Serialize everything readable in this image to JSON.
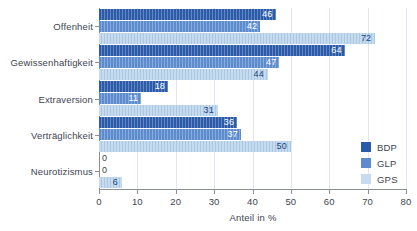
{
  "chart_data": {
    "type": "bar",
    "orientation": "horizontal",
    "title": "",
    "subtitle": "",
    "xlabel": "Anteil in %",
    "ylabel": "",
    "xlim": [
      0,
      80
    ],
    "xticks": [
      0,
      10,
      20,
      30,
      40,
      50,
      60,
      70,
      80
    ],
    "xtick_labels": [
      "0",
      "10",
      "20",
      "30",
      "40",
      "50",
      "60",
      "70",
      "80"
    ],
    "grid": true,
    "grid_axis": "x",
    "legend_position": "right-middle",
    "categories": [
      "Offenheit",
      "Gewissenhaftigkeit",
      "Extraversion",
      "Verträglichkeit",
      "Neurotizismus"
    ],
    "series": [
      {
        "name": "BDP",
        "color": "#2a5aa8",
        "values": [
          46,
          64,
          18,
          36,
          0
        ]
      },
      {
        "name": "GLP",
        "color": "#5c8bce",
        "values": [
          42,
          47,
          11,
          37,
          0
        ]
      },
      {
        "name": "GPS",
        "color": "#c5dcf0",
        "values": [
          72,
          44,
          31,
          50,
          6
        ]
      }
    ],
    "value_labels": [
      [
        "46",
        "42",
        "72"
      ],
      [
        "64",
        "47",
        "44"
      ],
      [
        "18",
        "11",
        "31"
      ],
      [
        "36",
        "37",
        "50"
      ],
      [
        "0",
        "0",
        "6"
      ]
    ]
  },
  "legend": {
    "entries": [
      {
        "label": "BDP",
        "color": "#2a5aa8"
      },
      {
        "label": "GLP",
        "color": "#5c8bce"
      },
      {
        "label": "GPS",
        "color": "#c5dcf0"
      }
    ]
  },
  "axis": {
    "x_title": "Anteil in %",
    "tick_labels": [
      "0",
      "10",
      "20",
      "30",
      "40",
      "50",
      "60",
      "70",
      "80"
    ]
  },
  "colors": {
    "series_dark": "#2a5aa8",
    "series_mid": "#5c8bce",
    "series_light": "#c5dcf0",
    "axis": "#8a8f96",
    "grid": "#dfe6ef",
    "text": "#3d4450",
    "background": "#ffffff"
  }
}
